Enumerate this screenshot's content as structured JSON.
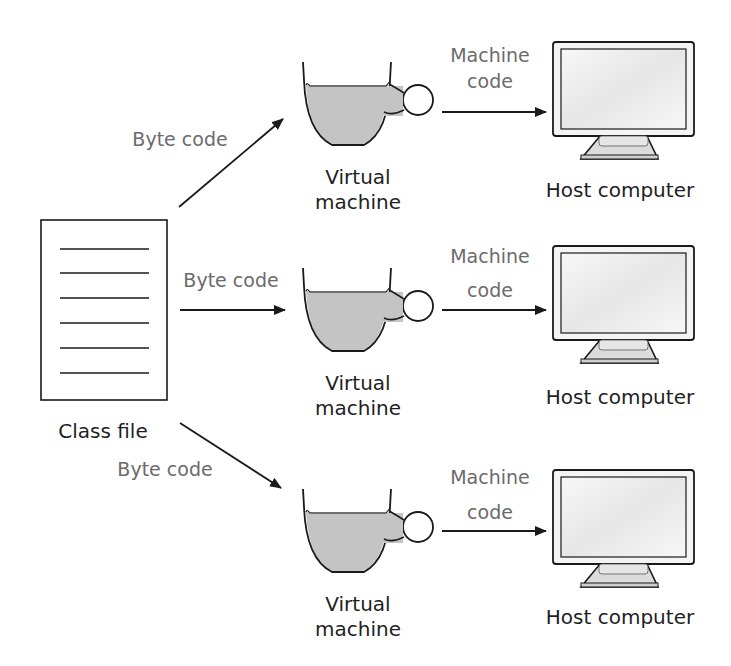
{
  "diagram": {
    "type": "flow",
    "class_file": {
      "label": "Class file",
      "line_count": 6
    },
    "flows": [
      {
        "byte_code_label": "Byte code",
        "vm_label_line1": "Virtual",
        "vm_label_line2": "machine",
        "machine_code_line1": "Machine",
        "machine_code_line2": "code",
        "host_label": "Host computer"
      },
      {
        "byte_code_label": "Byte code",
        "vm_label_line1": "Virtual",
        "vm_label_line2": "machine",
        "machine_code_line1": "Machine",
        "machine_code_line2": "code",
        "host_label": "Host computer"
      },
      {
        "byte_code_label": "Byte code",
        "vm_label_line1": "Virtual",
        "vm_label_line2": "machine",
        "machine_code_line1": "Machine",
        "machine_code_line2": "code",
        "host_label": "Host computer"
      }
    ],
    "colors": {
      "stroke": "#1a1a1a",
      "cup_fill": "#c4c4c4",
      "label_grey": "#6b6b6b",
      "label_dark": "#1f1f1f",
      "screen_fill": "#f2f2f2"
    }
  }
}
